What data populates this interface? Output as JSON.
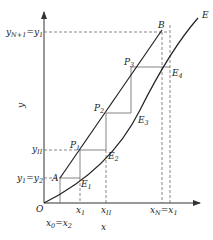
{
  "diagram": {
    "type": "stage-construction",
    "axes": {
      "x_label": "x",
      "y_label": "y",
      "origin_label": "O"
    },
    "curves": {
      "equilibrium_label": "E",
      "operating_end_label": "B",
      "operating_start_label": "A"
    },
    "points": {
      "P1": "P",
      "P1_sub": "1",
      "P2": "P",
      "P2_sub": "2",
      "P3": "P",
      "P3_sub": "3",
      "E1": "E",
      "E1_sub": "1",
      "E2": "E",
      "E2_sub": "2",
      "E3": "E",
      "E3_sub": "3",
      "E4": "E",
      "E4_sub": "4"
    },
    "y_ticks": [
      {
        "main": "y",
        "sub": "N+1",
        "eq": "=y",
        "eq_sub": "1"
      },
      {
        "main": "y",
        "sub": "II"
      },
      {
        "main": "y",
        "sub": "1",
        "eq": "=y",
        "eq_sub": "2"
      }
    ],
    "x_ticks": [
      {
        "main": "x",
        "sub": "1"
      },
      {
        "main": "x",
        "sub": "II"
      },
      {
        "main": "x",
        "sub": "N",
        "eq": "=x",
        "eq_sub": "1"
      },
      {
        "main": "x",
        "sub": "0",
        "eq": "=x",
        "eq_sub": "2"
      }
    ],
    "colors": {
      "line": "#222222",
      "step": "#666666",
      "dash": "#555555"
    }
  }
}
